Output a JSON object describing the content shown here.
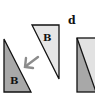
{
  "figure": {
    "panel_label": "d",
    "shapes": [
      {
        "id": "triangle-left",
        "label": "B",
        "fill": "#a8a8a8",
        "stroke": "#111111"
      },
      {
        "id": "triangle-upper",
        "label": "B",
        "fill": "#e6e6e6",
        "stroke": "#111111"
      },
      {
        "id": "square-right",
        "fill_upper": "#e2e2e2",
        "fill_lower": "#a8a8a8",
        "stroke": "#111111"
      }
    ],
    "arrow": {
      "color": "#8c8c8c",
      "direction": "down-left"
    }
  }
}
